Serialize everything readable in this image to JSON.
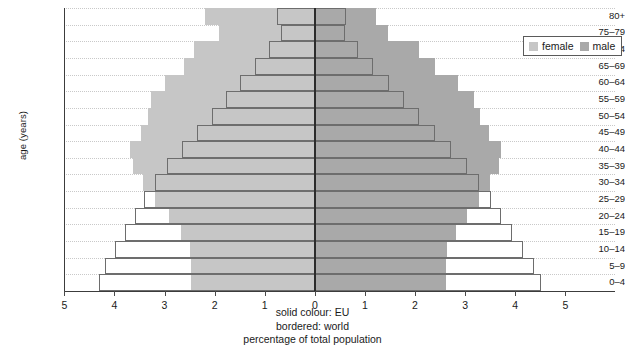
{
  "chart_data": {
    "type": "bar",
    "subtype": "population-pyramid",
    "title": "",
    "xlabel": "percentage of total population",
    "ylabel": "age (years)",
    "categories": [
      "0-4",
      "5-9",
      "10-14",
      "15-19",
      "20-24",
      "25-29",
      "30-34",
      "35-39",
      "40-44",
      "45-49",
      "50-54",
      "55-59",
      "60-64",
      "65-69",
      "70-74",
      "75-79",
      "80+"
    ],
    "xlim": [
      -5,
      5
    ],
    "xticks": [
      -5,
      -4,
      -3,
      -2,
      -1,
      0,
      1,
      2,
      3,
      4,
      5
    ],
    "xticklabels": [
      "5",
      "4",
      "3",
      "2",
      "1",
      "0",
      "1",
      "2",
      "3",
      "4",
      "5"
    ],
    "grid": true,
    "legend_position": "top-right",
    "series": [
      {
        "name": "female",
        "region": "EU",
        "side": "left",
        "style": "solid",
        "color": "#c6c6c6",
        "values": [
          2.48,
          2.48,
          2.5,
          2.68,
          2.92,
          3.18,
          3.42,
          3.62,
          3.68,
          3.46,
          3.32,
          3.26,
          3.0,
          2.62,
          2.42,
          1.92,
          2.2
        ]
      },
      {
        "name": "female",
        "region": "world",
        "side": "left",
        "style": "bordered",
        "color": "#6d6d6d",
        "values": [
          4.3,
          4.18,
          3.98,
          3.78,
          3.58,
          3.4,
          3.18,
          2.96,
          2.66,
          2.36,
          2.06,
          1.78,
          1.5,
          1.2,
          0.92,
          0.68,
          0.76
        ]
      },
      {
        "name": "male",
        "region": "EU",
        "side": "right",
        "style": "solid",
        "color": "#a9a9a9",
        "values": [
          2.62,
          2.62,
          2.64,
          2.82,
          3.04,
          3.28,
          3.5,
          3.68,
          3.72,
          3.48,
          3.3,
          3.18,
          2.86,
          2.4,
          2.08,
          1.46,
          1.22
        ]
      },
      {
        "name": "male",
        "region": "world",
        "side": "right",
        "style": "bordered",
        "color": "#6d6d6d",
        "values": [
          4.52,
          4.38,
          4.16,
          3.94,
          3.72,
          3.52,
          3.28,
          3.04,
          2.72,
          2.4,
          2.08,
          1.78,
          1.48,
          1.16,
          0.86,
          0.6,
          0.62
        ]
      }
    ]
  },
  "axes": {
    "ylabel": "age (years)",
    "ytick_labels": [
      "80+",
      "75–79",
      "70–74",
      "65–69",
      "60–64",
      "55–59",
      "50–54",
      "45–49",
      "40–44",
      "35–39",
      "30–34",
      "25–29",
      "20–24",
      "15–19",
      "10–14",
      "5–9",
      "0–4"
    ],
    "xtick_labels": [
      "5",
      "4",
      "3",
      "2",
      "1",
      "0",
      "1",
      "2",
      "3",
      "4",
      "5"
    ]
  },
  "legend": {
    "items": [
      {
        "label": "female",
        "swatch": "female-swatch",
        "color": "#c6c6c6"
      },
      {
        "label": "male",
        "swatch": "male-swatch",
        "color": "#a9a9a9"
      }
    ]
  },
  "caption": {
    "line1": "solid colour: EU",
    "line2": "bordered: world",
    "line3": "percentage of total population"
  }
}
